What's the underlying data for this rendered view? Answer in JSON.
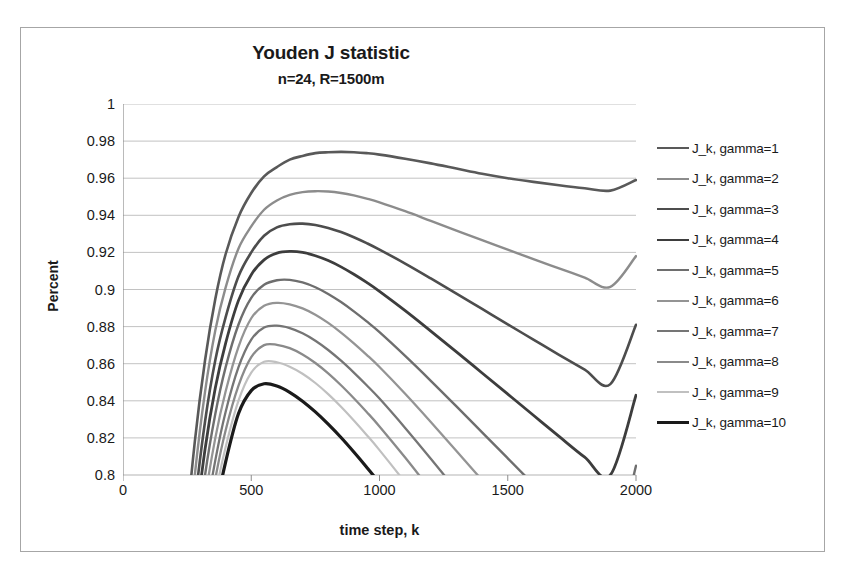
{
  "chart_data": {
    "type": "line",
    "title": "Youden J statistic",
    "subtitle": "n=24, R=1500m",
    "xlabel": "time step, k",
    "ylabel": "Percent",
    "xlim": [
      0,
      2000
    ],
    "ylim": [
      0.8,
      1
    ],
    "xticks": [
      "0",
      "500",
      "1000",
      "1500",
      "2000"
    ],
    "xtick_values": [
      0,
      500,
      1000,
      1500,
      2000
    ],
    "yticks": [
      "1",
      "0.98",
      "0.96",
      "0.94",
      "0.92",
      "0.9",
      "0.88",
      "0.86",
      "0.84",
      "0.82",
      "0.8"
    ],
    "ytick_values": [
      1,
      0.98,
      0.96,
      0.94,
      0.92,
      0.9,
      0.88,
      0.86,
      0.84,
      0.82,
      0.8
    ],
    "grid": "horizontal",
    "legend_position": "right",
    "x": [
      200,
      240,
      280,
      320,
      360,
      400,
      450,
      500,
      550,
      600,
      650,
      700,
      750,
      800,
      850,
      900,
      950,
      1000,
      1100,
      1200,
      1300,
      1400,
      1500,
      1600,
      1700,
      1800,
      1900,
      2000
    ],
    "series": [
      {
        "name": "J_k, gamma=1",
        "color": "#595959",
        "width": 2.6,
        "peak_k": 900,
        "peak_value": 0.974,
        "end_value": 0.959,
        "values": [
          0.69,
          0.76,
          0.818,
          0.862,
          0.895,
          0.919,
          0.939,
          0.952,
          0.961,
          0.966,
          0.97,
          0.972,
          0.9735,
          0.974,
          0.9742,
          0.974,
          0.9735,
          0.9727,
          0.9705,
          0.968,
          0.9652,
          0.9624,
          0.96,
          0.958,
          0.9562,
          0.9546,
          0.9533,
          0.959
        ]
      },
      {
        "name": "J_k, gamma=2",
        "color": "#8c8c8c",
        "width": 2.4,
        "peak_k": 830,
        "peak_value": 0.953,
        "end_value": 0.918,
        "values": [
          0.672,
          0.742,
          0.8,
          0.845,
          0.878,
          0.901,
          0.922,
          0.934,
          0.943,
          0.948,
          0.951,
          0.9525,
          0.953,
          0.9528,
          0.952,
          0.9507,
          0.949,
          0.947,
          0.9422,
          0.937,
          0.9318,
          0.9266,
          0.9215,
          0.9164,
          0.9114,
          0.9064,
          0.9014,
          0.918
        ]
      },
      {
        "name": "J_k, gamma=3",
        "color": "#4d4d4d",
        "width": 2.6,
        "peak_k": 760,
        "peak_value": 0.9355,
        "end_value": 0.881,
        "values": [
          0.655,
          0.726,
          0.784,
          0.829,
          0.862,
          0.885,
          0.907,
          0.92,
          0.929,
          0.9335,
          0.9352,
          0.9355,
          0.9348,
          0.9332,
          0.931,
          0.9282,
          0.925,
          0.9215,
          0.914,
          0.906,
          0.8978,
          0.8895,
          0.8812,
          0.873,
          0.8648,
          0.8568,
          0.849,
          0.881
        ]
      },
      {
        "name": "J_k, gamma=4",
        "color": "#3d3d3d",
        "width": 2.8,
        "peak_k": 700,
        "peak_value": 0.9205,
        "end_value": 0.843,
        "values": [
          0.64,
          0.711,
          0.769,
          0.814,
          0.847,
          0.871,
          0.894,
          0.908,
          0.916,
          0.9196,
          0.9205,
          0.92,
          0.9182,
          0.9156,
          0.9122,
          0.9082,
          0.9038,
          0.899,
          0.8886,
          0.8776,
          0.8664,
          0.855,
          0.8436,
          0.8322,
          0.8208,
          0.8096,
          0.8,
          0.843
        ]
      },
      {
        "name": "J_k, gamma=5",
        "color": "#6e6e6e",
        "width": 2.4,
        "peak_k": 660,
        "peak_value": 0.9055,
        "end_value": 0.805,
        "values": [
          0.626,
          0.697,
          0.755,
          0.8,
          0.833,
          0.858,
          0.881,
          0.8955,
          0.9025,
          0.905,
          0.9052,
          0.9038,
          0.9012,
          0.8976,
          0.8932,
          0.8882,
          0.8828,
          0.877,
          0.8642,
          0.8508,
          0.837,
          0.823,
          0.809,
          0.795,
          0.781,
          0.767,
          0.753,
          0.805
        ]
      },
      {
        "name": "J_k, gamma=6",
        "color": "#949494",
        "width": 2.3,
        "peak_k": 630,
        "peak_value": 0.893,
        "end_value": 0.8,
        "values": [
          0.613,
          0.684,
          0.742,
          0.787,
          0.82,
          0.845,
          0.869,
          0.8845,
          0.8912,
          0.8928,
          0.892,
          0.8898,
          0.8864,
          0.882,
          0.8768,
          0.871,
          0.8648,
          0.8582,
          0.8438,
          0.8286,
          0.813,
          0.7972,
          0.7812,
          0.765,
          0.7488,
          0.7325,
          0.7162,
          0.7
        ]
      },
      {
        "name": "J_k, gamma=7",
        "color": "#757575",
        "width": 2.3,
        "peak_k": 610,
        "peak_value": 0.8805,
        "end_value": 0.8,
        "values": [
          0.601,
          0.672,
          0.73,
          0.775,
          0.808,
          0.834,
          0.858,
          0.873,
          0.8795,
          0.8805,
          0.8792,
          0.8764,
          0.8724,
          0.8674,
          0.8616,
          0.8552,
          0.8484,
          0.8412,
          0.8254,
          0.8088,
          0.7918,
          0.7745,
          0.757,
          0.7394,
          0.7217,
          0.704,
          0.6862,
          0.6684
        ]
      },
      {
        "name": "J_k, gamma=8",
        "color": "#8a8a8a",
        "width": 2.3,
        "peak_k": 585,
        "peak_value": 0.8705,
        "end_value": 0.8,
        "values": [
          0.59,
          0.661,
          0.719,
          0.764,
          0.798,
          0.824,
          0.848,
          0.8635,
          0.87,
          0.8702,
          0.8684,
          0.865,
          0.8604,
          0.8548,
          0.8484,
          0.8414,
          0.834,
          0.8262,
          0.8094,
          0.7918,
          0.7738,
          0.7554,
          0.7368,
          0.718,
          0.6992,
          0.6804,
          0.6615,
          0.6426
        ]
      },
      {
        "name": "J_k, gamma=9",
        "color": "#c0c0c0",
        "width": 2.2,
        "peak_k": 565,
        "peak_value": 0.8612,
        "end_value": 0.8,
        "values": [
          0.58,
          0.651,
          0.709,
          0.755,
          0.789,
          0.815,
          0.84,
          0.8552,
          0.861,
          0.8608,
          0.8584,
          0.8546,
          0.8496,
          0.8436,
          0.8368,
          0.8294,
          0.8216,
          0.8134,
          0.796,
          0.7778,
          0.7592,
          0.7403,
          0.7212,
          0.7019,
          0.6826,
          0.6633,
          0.644,
          0.6246
        ]
      },
      {
        "name": "J_k, gamma=10",
        "color": "#1a1a1a",
        "width": 3.2,
        "peak_k": 540,
        "peak_value": 0.8492,
        "end_value": 0.8,
        "values": [
          0.57,
          0.641,
          0.7,
          0.746,
          0.78,
          0.807,
          0.833,
          0.8455,
          0.8492,
          0.848,
          0.8446,
          0.8398,
          0.834,
          0.8274,
          0.8202,
          0.8124,
          0.8042,
          0.7956,
          0.7776,
          0.759,
          0.74,
          0.7208,
          0.7014,
          0.6819,
          0.6623,
          0.6427,
          0.6231,
          0.6034
        ]
      }
    ]
  },
  "colors": {
    "border": "#a6a6a6",
    "gridline": "#b3b3b3",
    "axis": "#8c8c8c",
    "text": "#1a1a1a"
  }
}
